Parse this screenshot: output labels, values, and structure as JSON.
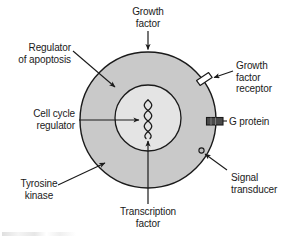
{
  "figure": {
    "type": "biology-cell-signaling-diagram",
    "background_color": "#ffffff",
    "cell": {
      "name": "cell",
      "fill_color": "#c9c9c9",
      "stroke_color": "#1a1a1a",
      "center_x": 148,
      "center_y": 120,
      "radius": 68
    },
    "nucleus": {
      "name": "nucleus",
      "fill_color": "#e4e4e4",
      "stroke_color": "#1a1a1a",
      "center_x": 148,
      "center_y": 118,
      "radius": 33
    },
    "dna": {
      "name": "dna-double-helix",
      "stroke_color": "#1a1a1a",
      "center_x": 148,
      "top_y": 100,
      "bottom_y": 138
    },
    "membrane_features": [
      {
        "key": "growth-factor-receptor",
        "shape": "parallelogram",
        "fill_color": "#ffffff",
        "stroke_color": "#1a1a1a"
      },
      {
        "key": "g-protein",
        "shape": "rectangle",
        "fill_color": "#4a4a4a",
        "stroke_color": "#1a1a1a"
      },
      {
        "key": "signal-transducer",
        "shape": "small-circle",
        "fill_color": "#bdbdbd",
        "stroke_color": "#1a1a1a"
      }
    ]
  },
  "labels": {
    "growth_factor": {
      "text": "Growth\nfactor",
      "align": "center",
      "connector": "arrow-down"
    },
    "regulator_of_apoptosis": {
      "text": "Regulator\nof apoptosis",
      "align": "right",
      "connector": "arrow-down-right"
    },
    "cell_cycle_regulator": {
      "text": "Cell cycle\nregulator",
      "align": "right",
      "connector": "arrow-right"
    },
    "tyrosine_kinase": {
      "text": "Tyrosine\nkinase",
      "align": "center",
      "connector": "arrow-up-right"
    },
    "transcription_factor": {
      "text": "Transcription\nfactor",
      "align": "center",
      "connector": "arrow-up"
    },
    "growth_factor_receptor": {
      "text": "Growth\nfactor\nreceptor",
      "align": "left",
      "connector": "arrow-left"
    },
    "g_protein": {
      "text": "G protein",
      "align": "left",
      "connector": "none"
    },
    "signal_transducer": {
      "text": "Signal\ntransducer",
      "align": "left",
      "connector": "arrow-up-left"
    }
  },
  "colors": {
    "ink": "#1a1a1a",
    "cell_gray": "#c9c9c9",
    "nucleus_gray": "#e4e4e4",
    "g_protein_gray": "#4a4a4a",
    "paper": "#ffffff"
  }
}
